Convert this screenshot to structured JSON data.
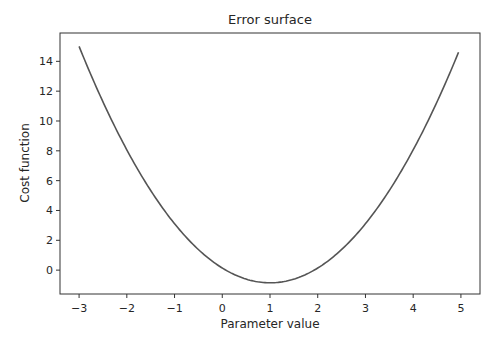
{
  "chart_data": {
    "type": "line",
    "title": "Error surface",
    "xlabel": "Parameter value",
    "ylabel": "Cost function",
    "xlim": [
      -3.4,
      5.4
    ],
    "ylim": [
      -1.6,
      15.9
    ],
    "xticks": [
      -3,
      -2,
      -1,
      0,
      1,
      2,
      3,
      4,
      5
    ],
    "xtick_labels": [
      "−3",
      "−2",
      "−1",
      "0",
      "1",
      "2",
      "3",
      "4",
      "5"
    ],
    "yticks": [
      0,
      2,
      4,
      6,
      8,
      10,
      12,
      14
    ],
    "ytick_labels": [
      "0",
      "2",
      "4",
      "6",
      "8",
      "10",
      "12",
      "14"
    ],
    "grid": false,
    "legend": null,
    "series": [
      {
        "name": "cost",
        "color": "#555555",
        "x": [
          -3.0,
          -2.5,
          -2.0,
          -1.5,
          -1.0,
          -0.5,
          0.0,
          0.5,
          1.0,
          1.5,
          2.0,
          2.5,
          3.0,
          3.5,
          4.0,
          4.5,
          4.95
        ],
        "y": [
          15.0,
          11.3,
          8.1,
          5.3,
          3.1,
          1.4,
          0.15,
          -0.6,
          -0.85,
          -0.6,
          0.15,
          1.4,
          3.1,
          5.3,
          8.1,
          11.3,
          14.6
        ]
      }
    ]
  }
}
